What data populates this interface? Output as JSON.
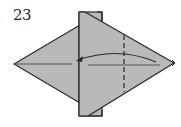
{
  "diagram": {
    "step_number": "23",
    "colors": {
      "paper": "#b9b9b9",
      "line": "#2b2b2b",
      "background": "#ffffff"
    },
    "elements": [
      {
        "type": "left-diamond-flap",
        "description": "left kite flap with center crease"
      },
      {
        "type": "vertical-strip",
        "description": "raised vertical strip layer"
      },
      {
        "type": "right-point",
        "description": "right pointed flap"
      },
      {
        "type": "valley-fold-line",
        "style": "dashed",
        "orientation": "vertical"
      },
      {
        "type": "fold-arrow",
        "direction": "right-to-left"
      }
    ]
  }
}
